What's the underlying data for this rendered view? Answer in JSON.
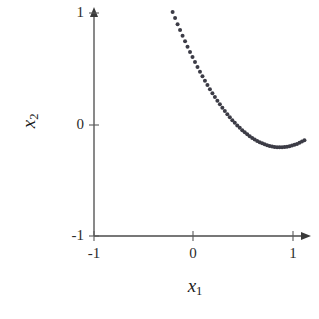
{
  "chart_data": {
    "type": "scatter",
    "title": "",
    "subtitle": "",
    "xlabel": "x₁",
    "ylabel": "x₂",
    "xlabel_base": "x",
    "xlabel_sub": "1",
    "ylabel_base": "x",
    "ylabel_sub": "2",
    "xlim": [
      -1,
      1
    ],
    "ylim": [
      -1,
      1
    ],
    "xticks": [
      -1,
      0,
      1
    ],
    "yticks": [
      -1,
      0,
      1
    ],
    "xticklabels": [
      "-1",
      "0",
      "1"
    ],
    "yticklabels": [
      "-1",
      "0",
      "1"
    ],
    "grid": false,
    "legend": false,
    "legend_position": "none",
    "axis_style": "arrows-at-positive-ends",
    "marker": "dot",
    "marker_color": "#3c3c46",
    "marker_size_px": 2.0,
    "axis_color": "#4a4a4a",
    "background": "#ffffff",
    "series": [
      {
        "name": "curve",
        "style": "dotted",
        "x": [
          -0.21,
          -0.185,
          -0.16,
          -0.135,
          -0.11,
          -0.085,
          -0.06,
          -0.035,
          -0.01,
          0.015,
          0.04,
          0.065,
          0.09,
          0.115,
          0.14,
          0.165,
          0.19,
          0.215,
          0.24,
          0.265,
          0.29,
          0.315,
          0.34,
          0.365,
          0.39,
          0.415,
          0.44,
          0.465,
          0.49,
          0.515,
          0.54,
          0.565,
          0.59,
          0.615,
          0.64,
          0.665,
          0.69,
          0.715,
          0.74,
          0.765,
          0.79,
          0.815,
          0.84,
          0.865,
          0.89,
          0.915,
          0.94,
          0.965,
          0.99,
          1.015,
          1.04,
          1.065,
          1.09,
          1.115
        ],
        "y": [
          1.01,
          0.955,
          0.9,
          0.848,
          0.797,
          0.747,
          0.698,
          0.651,
          0.605,
          0.56,
          0.516,
          0.474,
          0.433,
          0.393,
          0.354,
          0.317,
          0.281,
          0.246,
          0.213,
          0.181,
          0.15,
          0.12,
          0.092,
          0.065,
          0.039,
          0.015,
          -0.008,
          -0.03,
          -0.051,
          -0.07,
          -0.088,
          -0.105,
          -0.12,
          -0.134,
          -0.147,
          -0.159,
          -0.169,
          -0.178,
          -0.186,
          -0.192,
          -0.197,
          -0.201,
          -0.203,
          -0.204,
          -0.204,
          -0.202,
          -0.199,
          -0.195,
          -0.189,
          -0.182,
          -0.174,
          -0.164,
          -0.153,
          -0.141
        ]
      }
    ],
    "annotations": [],
    "minimum_point": {
      "x": 0.63,
      "y": -0.39
    },
    "start_point": {
      "x": -0.21,
      "y": 1.01
    },
    "end_point": {
      "x": 1.12,
      "y": -0.04
    }
  },
  "axes": {
    "x_tick_left": "-1",
    "x_tick_mid": "0",
    "x_tick_right": "1",
    "y_tick_bottom": "-1",
    "y_tick_mid": "0",
    "y_tick_top": "1",
    "x_axis_title_base": "x",
    "x_axis_title_sub": "1",
    "y_axis_title_base": "x",
    "y_axis_title_sub": "2"
  }
}
